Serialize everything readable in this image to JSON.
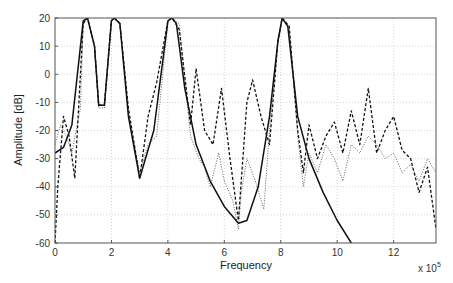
{
  "chart_data": {
    "type": "line",
    "title": "",
    "xlabel": "Frequency",
    "ylabel": "Amplitude [dB]",
    "x_multiplier_label": "x 10",
    "x_multiplier_exp": "5",
    "xlim": [
      0,
      13.5
    ],
    "ylim": [
      -60,
      20
    ],
    "x_ticks": [
      0,
      2,
      4,
      6,
      8,
      10,
      12
    ],
    "y_ticks": [
      20,
      10,
      0,
      -10,
      -20,
      -30,
      -40,
      -50,
      -60
    ],
    "grid": true,
    "legend": null,
    "series": [
      {
        "name": "solid",
        "style": "solid",
        "color": "#111111",
        "x": [
          0,
          0.3,
          0.6,
          1.0,
          1.15,
          1.4,
          1.55,
          1.75,
          2.0,
          2.1,
          2.3,
          2.6,
          3.0,
          3.5,
          4.0,
          4.15,
          4.3,
          4.6,
          5.0,
          5.5,
          6.0,
          6.5,
          6.8,
          7.2,
          7.6,
          7.9,
          8.05,
          8.25,
          8.6,
          9.0,
          9.5,
          10.0,
          10.5
        ],
        "values": [
          -28,
          -26,
          -18,
          19,
          20,
          10,
          -11,
          -11,
          19,
          20,
          18,
          -15,
          -37,
          -20,
          19,
          20,
          18,
          -5,
          -25,
          -38,
          -47,
          -53,
          -52,
          -40,
          -15,
          12,
          20,
          17,
          -15,
          -30,
          -42,
          -52,
          -60
        ]
      },
      {
        "name": "dashed",
        "style": "dashed",
        "color": "#111111",
        "x": [
          0,
          0.1,
          0.3,
          0.5,
          0.7,
          1.0,
          1.15,
          1.4,
          1.55,
          1.75,
          2.0,
          2.1,
          2.3,
          2.6,
          3.0,
          3.3,
          3.6,
          4.0,
          4.15,
          4.4,
          4.8,
          5.0,
          5.3,
          5.6,
          5.9,
          6.2,
          6.5,
          6.8,
          7.0,
          7.3,
          7.6,
          7.9,
          8.05,
          8.3,
          8.6,
          8.8,
          9.0,
          9.3,
          9.6,
          9.9,
          10.2,
          10.5,
          10.8,
          11.1,
          11.4,
          11.7,
          12.0,
          12.3,
          12.6,
          12.9,
          13.2,
          13.5
        ],
        "values": [
          -60,
          -40,
          -15,
          -22,
          -37,
          18,
          20,
          10,
          -11,
          -11,
          19,
          20,
          18,
          -12,
          -37,
          -15,
          -3,
          19,
          20,
          16,
          -18,
          2,
          -20,
          -25,
          -5,
          -30,
          -52,
          -10,
          -2,
          -15,
          -25,
          12,
          20,
          17,
          -20,
          -35,
          -18,
          -30,
          -22,
          -17,
          -28,
          -13,
          -25,
          -5,
          -28,
          -20,
          -15,
          -27,
          -30,
          -42,
          -33,
          -55
        ]
      },
      {
        "name": "dotted",
        "style": "dotted",
        "color": "#555555",
        "x": [
          0,
          0.2,
          0.4,
          0.6,
          0.9,
          1.0,
          1.15,
          1.4,
          1.55,
          1.75,
          2.0,
          2.1,
          2.3,
          2.6,
          3.0,
          3.3,
          3.6,
          4.0,
          4.15,
          4.4,
          4.8,
          5.1,
          5.3,
          5.5,
          5.8,
          6.0,
          6.3,
          6.5,
          6.6,
          6.8,
          7.1,
          7.4,
          7.6,
          7.9,
          8.05,
          8.3,
          8.6,
          8.8,
          9.0,
          9.3,
          9.6,
          9.9,
          10.2,
          10.5,
          10.8,
          11.1,
          11.4,
          11.7,
          12.0,
          12.3,
          12.6,
          12.9,
          13.2,
          13.5
        ],
        "values": [
          -25,
          -18,
          -22,
          -28,
          -12,
          18,
          20,
          10,
          -12,
          -12,
          19,
          20,
          18,
          -14,
          -35,
          -25,
          -22,
          19,
          20,
          18,
          -22,
          -30,
          -33,
          -40,
          -28,
          -38,
          -45,
          -55,
          -42,
          -30,
          -38,
          -48,
          -20,
          12,
          20,
          17,
          -22,
          -40,
          -28,
          -35,
          -25,
          -30,
          -38,
          -25,
          -28,
          -22,
          -25,
          -30,
          -28,
          -35,
          -32,
          -38,
          -30,
          -35
        ]
      }
    ]
  }
}
